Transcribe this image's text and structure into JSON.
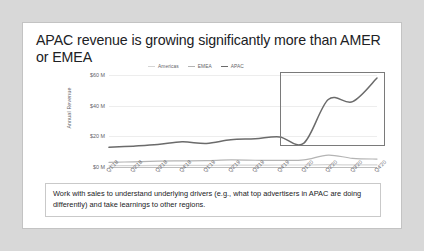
{
  "slide": {
    "title": "APAC revenue is growing significantly more than AMER or EMEA",
    "takeaway": "Work with sales to understand underlying drivers (e.g., what top advertisers in APAC are doing differently) and take learnings to other regions."
  },
  "colors": {
    "americas": "#d5d5d5",
    "emea": "#b4b4b4",
    "apac": "#6b6b6b",
    "grid": "#ededed",
    "axis": "#bdbdbd",
    "text": "#202124",
    "muted": "#5f6368",
    "highlight_box": "#7a7a7a",
    "frame": "#c3c3c3",
    "page_background": "#d8d8d8"
  },
  "chart_data": {
    "type": "line",
    "title": "",
    "xlabel": "",
    "ylabel": "Annual Revenue",
    "ylim": [
      0,
      60
    ],
    "yticks": [
      0,
      20,
      40,
      60
    ],
    "ytick_labels": [
      "$0 M",
      "$20 M",
      "$40 M",
      "$60 M"
    ],
    "grid": true,
    "legend_position": "top",
    "categories": [
      "Q1'18",
      "Q2'18",
      "Q3'18",
      "Q4'18",
      "Q1'19",
      "Q2'19",
      "Q3'19",
      "Q4'19",
      "Q1'20",
      "Q2'20",
      "Q3'20",
      "Q4'20"
    ],
    "series": [
      {
        "name": "Americas",
        "color": "#d5d5d5",
        "values": [
          0.8,
          0.9,
          1.0,
          1.0,
          1.1,
          1.2,
          1.2,
          1.3,
          1.3,
          1.5,
          1.4,
          1.4
        ]
      },
      {
        "name": "EMEA",
        "color": "#b4b4b4",
        "values": [
          3.0,
          3.4,
          3.8,
          4.0,
          4.2,
          4.6,
          4.4,
          4.3,
          4.6,
          7.8,
          5.6,
          5.2
        ]
      },
      {
        "name": "APAC",
        "color": "#6b6b6b",
        "values": [
          12.8,
          13.6,
          14.6,
          16.4,
          15.4,
          17.8,
          18.4,
          19.6,
          15.6,
          44.0,
          42.6,
          58.0
        ]
      }
    ],
    "annotations": [
      {
        "type": "highlight-box",
        "label": "APAC growth callout",
        "x_start": "Q4'19",
        "x_end": "Q4'20",
        "y_min": 14,
        "y_max": 62
      }
    ]
  }
}
